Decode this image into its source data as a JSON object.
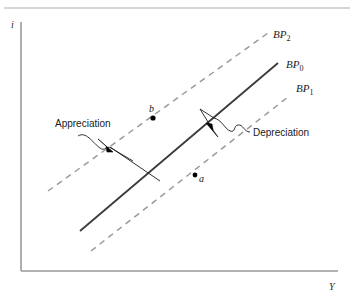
{
  "figure": {
    "type": "economics-diagram",
    "background_color": "#ffffff",
    "top_rule_color": "#c8c8c8"
  },
  "axes": {
    "y_label": "i",
    "x_label": "Y",
    "axis_color": "#9a9a9a",
    "origin": {
      "x": 21,
      "y": 271
    },
    "y_top": 22,
    "x_right": 338
  },
  "curves": [
    {
      "id": "bp2",
      "label_base": "BP",
      "label_sub": "2",
      "style": "dashed",
      "color": "#9a9a9a",
      "x1": 48,
      "y1": 191,
      "x2": 268,
      "y2": 33,
      "label_x": 273,
      "label_y": 38
    },
    {
      "id": "bp0",
      "label_base": "BP",
      "label_sub": "0",
      "style": "solid",
      "color": "#3a3a3a",
      "x1": 80,
      "y1": 231,
      "x2": 278,
      "y2": 63,
      "label_x": 286,
      "label_y": 68
    },
    {
      "id": "bp1",
      "label_base": "BP",
      "label_sub": "1",
      "style": "dashed",
      "color": "#9a9a9a",
      "x1": 91,
      "y1": 251,
      "x2": 288,
      "y2": 97,
      "label_x": 296,
      "label_y": 92
    }
  ],
  "points": [
    {
      "id": "b",
      "label": "b",
      "cx": 153,
      "cy": 118,
      "label_x": 150,
      "label_y": 112,
      "color": "#000000",
      "radius": 2.6
    },
    {
      "id": "a",
      "label": "a",
      "cx": 195,
      "cy": 175,
      "label_x": 199,
      "label_y": 182,
      "color": "#000000",
      "radius": 2.4
    }
  ],
  "annotations": [
    {
      "id": "appreciation",
      "label": "Appreciation",
      "text_x": 55,
      "text_y": 127,
      "squiggle": "M 78 136 C 86 131, 92 142, 99 148 C 104 152, 106 146, 110 148",
      "leader": "M 110 148 L 136 164",
      "arrow": "M 112 132 L 98 147 L 106 147 L 104 140 Z",
      "arrow_tip_x": 98,
      "arrow_tip_y": 147,
      "leader2": "M 136 164 L 160 178",
      "color": "#1a1a1a"
    },
    {
      "id": "depreciation",
      "label": "Depreciation",
      "text_x": 253,
      "text_y": 135,
      "squiggle": "M 248 131 C 243 126, 238 136, 233 131 C 229 127, 234 121, 228 119",
      "leader": "M 228 119 L 212 118",
      "arrow": "M 203 117 L 216 132 L 209 131 L 210 124 Z",
      "arrow_tip_x": 216,
      "arrow_tip_y": 132,
      "leader2": "M 203 117 L 196 108",
      "color": "#1a1a1a"
    }
  ]
}
